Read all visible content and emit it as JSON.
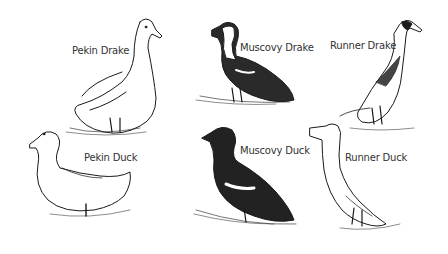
{
  "illustration": {
    "background": "#ffffff",
    "ink": "#1a1a1a",
    "birds": [
      {
        "id": "pekin-drake",
        "label": "Pekin Drake"
      },
      {
        "id": "muscovy-drake",
        "label": "Muscovy Drake"
      },
      {
        "id": "runner-drake",
        "label": "Runner Drake"
      },
      {
        "id": "pekin-duck",
        "label": "Pekin Duck"
      },
      {
        "id": "muscovy-duck",
        "label": "Muscovy Duck"
      },
      {
        "id": "runner-duck",
        "label": "Runner Duck"
      }
    ]
  }
}
